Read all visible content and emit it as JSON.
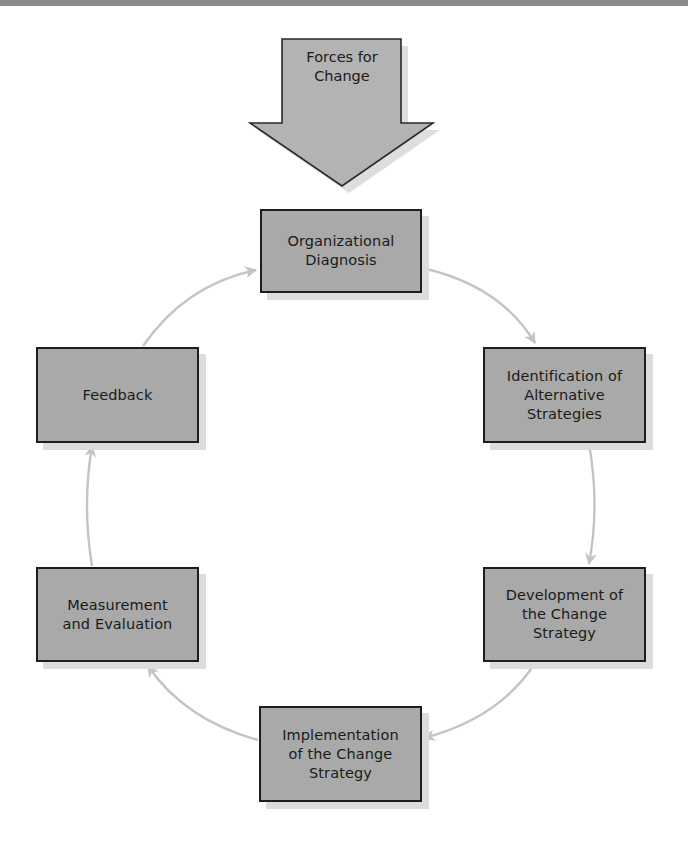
{
  "diagram": {
    "type": "cycle",
    "colors": {
      "top_band": "#8c8c8c",
      "box_fill": "#a9a9a9",
      "box_border": "#1e1e1e",
      "box_shadow": "#dcdcdc",
      "connector": "#c4c4c4",
      "input_arrow_fill": "#b3b3b3"
    },
    "input": {
      "label": "Forces for\nChange"
    },
    "nodes": [
      {
        "id": "organizational-diagnosis",
        "label": "Organizational\nDiagnosis"
      },
      {
        "id": "identification-of-alternative-strategies",
        "label": "Identification of\nAlternative\nStrategies"
      },
      {
        "id": "development-of-the-change-strategy",
        "label": "Development of\nthe Change\nStrategy"
      },
      {
        "id": "implementation-of-the-change-strategy",
        "label": "Implementation\nof the Change\nStrategy"
      },
      {
        "id": "measurement-and-evaluation",
        "label": "Measurement\nand Evaluation"
      },
      {
        "id": "feedback",
        "label": "Feedback"
      }
    ],
    "edges": [
      {
        "from": "Forces for Change",
        "to": "Organizational Diagnosis"
      },
      {
        "from": "Organizational Diagnosis",
        "to": "Identification of Alternative Strategies"
      },
      {
        "from": "Identification of Alternative Strategies",
        "to": "Development of the Change Strategy"
      },
      {
        "from": "Development of the Change Strategy",
        "to": "Implementation of the Change Strategy"
      },
      {
        "from": "Implementation of the Change Strategy",
        "to": "Measurement and Evaluation"
      },
      {
        "from": "Measurement and Evaluation",
        "to": "Feedback"
      },
      {
        "from": "Feedback",
        "to": "Organizational Diagnosis"
      }
    ]
  }
}
